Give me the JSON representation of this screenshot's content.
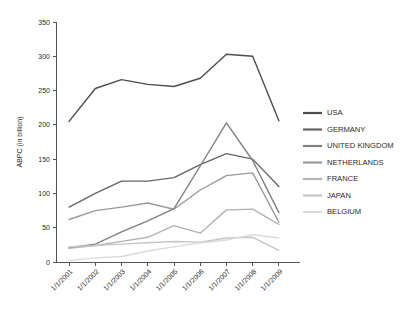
{
  "chart_data": {
    "type": "line",
    "title": "",
    "xlabel": "",
    "ylabel": "ABPC (in billion)",
    "categories": [
      "1/1/2001",
      "1/1/2002",
      "1/1/2003",
      "1/1/2004",
      "1/1/2005",
      "1/1/2006",
      "1/1/2007",
      "1/1/2008",
      "1/1/2009"
    ],
    "ylim": [
      0,
      350
    ],
    "yticks": [
      0,
      50,
      100,
      150,
      200,
      250,
      300,
      350
    ],
    "grid": false,
    "legend_position": "right",
    "series": [
      {
        "name": "USA",
        "color": "#4d4d4d",
        "values": [
          205,
          253,
          266,
          259,
          256,
          268,
          303,
          300,
          206
        ]
      },
      {
        "name": "GERMANY",
        "color": "#666666",
        "values": [
          80,
          100,
          118,
          118,
          123,
          142,
          158,
          150,
          110
        ]
      },
      {
        "name": "UNITED KINGDOM",
        "color": "#808080",
        "values": [
          21,
          26,
          44,
          60,
          78,
          140,
          203,
          148,
          72
        ]
      },
      {
        "name": "NETHERLANDS",
        "color": "#9a9a9a",
        "values": [
          62,
          75,
          80,
          86,
          77,
          105,
          126,
          130,
          58
        ]
      },
      {
        "name": "FRANCE",
        "color": "#b3b3b3",
        "values": [
          20,
          24,
          30,
          36,
          53,
          42,
          76,
          77,
          55
        ]
      },
      {
        "name": "JAPAN",
        "color": "#c6c6c6",
        "values": [
          22,
          24,
          26,
          28,
          30,
          29,
          35,
          36,
          17
        ]
      },
      {
        "name": "BELGIUM",
        "color": "#dadada",
        "values": [
          2,
          6,
          8,
          16,
          22,
          28,
          32,
          40,
          35
        ]
      }
    ]
  },
  "legend": {
    "items": [
      {
        "label": "USA"
      },
      {
        "label": "GERMANY"
      },
      {
        "label": "UNITED KINGDOM"
      },
      {
        "label": "NETHERLANDS"
      },
      {
        "label": "FRANCE"
      },
      {
        "label": "JAPAN"
      },
      {
        "label": "BELGIUM"
      }
    ]
  }
}
